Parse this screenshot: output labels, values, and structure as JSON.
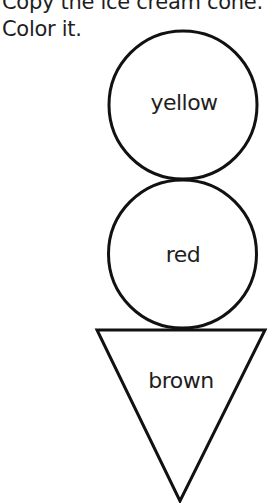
{
  "instructions": {
    "line1": "Copy the ice cream cone.",
    "line2": "Color it."
  },
  "figure": {
    "scoops": [
      {
        "shape": "circle",
        "label": "yellow"
      },
      {
        "shape": "circle",
        "label": "red"
      }
    ],
    "cone": {
      "shape": "triangle",
      "label": "brown"
    }
  },
  "colors": {
    "stroke": "#111111",
    "background": "#ffffff",
    "text": "#1e1e1e"
  }
}
